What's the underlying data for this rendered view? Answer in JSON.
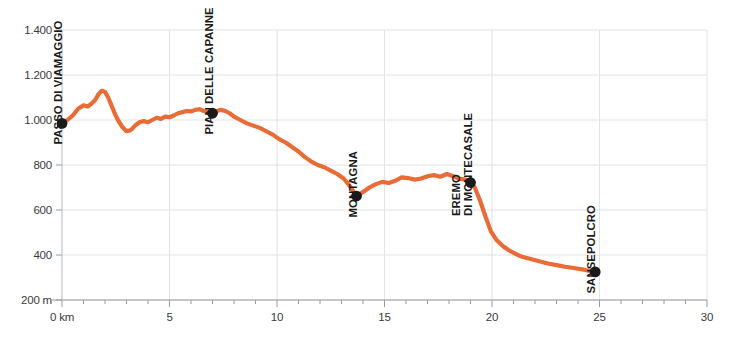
{
  "chart_data": {
    "type": "line",
    "title": "",
    "subtitle": "",
    "xlabel": "",
    "ylabel": "",
    "xlim": [
      0,
      30
    ],
    "ylim": [
      200,
      1400
    ],
    "grid": true,
    "legend": "none",
    "line_color": "#E96B35",
    "marker_color": "#1a1a1a",
    "x_unit_suffix": " km",
    "y_unit_suffix": " m",
    "x_ticks": [
      {
        "value": 0,
        "label": "0 km"
      },
      {
        "value": 5,
        "label": "5"
      },
      {
        "value": 10,
        "label": "10"
      },
      {
        "value": 15,
        "label": "15"
      },
      {
        "value": 20,
        "label": "20"
      },
      {
        "value": 25,
        "label": "25"
      },
      {
        "value": 30,
        "label": "30"
      }
    ],
    "x_minor_tick_interval": 1,
    "y_ticks": [
      {
        "value": 1400,
        "label": "1.400"
      },
      {
        "value": 1200,
        "label": "1.200"
      },
      {
        "value": 1000,
        "label": "1.000"
      },
      {
        "value": 800,
        "label": "800"
      },
      {
        "value": 600,
        "label": "600"
      },
      {
        "value": 400,
        "label": "400"
      },
      {
        "value": 200,
        "label": "200 m"
      }
    ],
    "series": [
      {
        "name": "elevation-profile",
        "x": [
          0.0,
          0.25,
          0.5,
          0.75,
          1.0,
          1.2,
          1.4,
          1.55,
          1.7,
          1.85,
          2.0,
          2.15,
          2.3,
          2.45,
          2.6,
          2.8,
          3.0,
          3.2,
          3.4,
          3.6,
          3.8,
          4.0,
          4.2,
          4.4,
          4.6,
          4.8,
          5.0,
          5.2,
          5.4,
          5.6,
          5.8,
          6.0,
          6.2,
          6.4,
          6.6,
          6.8,
          7.0,
          7.2,
          7.4,
          7.6,
          7.8,
          8.0,
          8.3,
          8.6,
          8.9,
          9.2,
          9.5,
          9.8,
          10.1,
          10.4,
          10.7,
          11.0,
          11.3,
          11.6,
          11.9,
          12.2,
          12.5,
          12.8,
          13.1,
          13.4,
          13.7,
          14.0,
          14.3,
          14.6,
          14.9,
          15.2,
          15.5,
          15.8,
          16.1,
          16.4,
          16.7,
          17.0,
          17.3,
          17.6,
          17.9,
          18.2,
          18.5,
          18.8,
          19.0,
          19.2,
          19.45,
          19.7,
          19.95,
          20.2,
          20.5,
          20.8,
          21.1,
          21.4,
          21.8,
          22.2,
          22.6,
          23.0,
          23.4,
          23.8,
          24.2,
          24.5,
          24.8
        ],
        "y": [
          985,
          1000,
          1020,
          1050,
          1065,
          1060,
          1075,
          1090,
          1115,
          1130,
          1125,
          1100,
          1065,
          1030,
          1000,
          970,
          950,
          955,
          975,
          990,
          995,
          990,
          1000,
          1010,
          1005,
          1015,
          1012,
          1020,
          1030,
          1035,
          1040,
          1038,
          1045,
          1048,
          1040,
          1035,
          1030,
          1040,
          1045,
          1040,
          1030,
          1015,
          1000,
          985,
          975,
          965,
          950,
          935,
          915,
          900,
          880,
          860,
          835,
          815,
          800,
          790,
          775,
          760,
          740,
          705,
          662,
          680,
          700,
          715,
          725,
          720,
          730,
          745,
          742,
          735,
          740,
          750,
          755,
          748,
          760,
          750,
          738,
          735,
          722,
          700,
          640,
          570,
          505,
          468,
          440,
          420,
          405,
          392,
          382,
          372,
          362,
          355,
          348,
          342,
          336,
          330,
          325
        ]
      }
    ],
    "waypoints": [
      {
        "name": "passo-di-viamaggio",
        "label_line1": "PASSO DI VIAMAGGIO",
        "label_line2": "",
        "x": 0.0,
        "y": 985
      },
      {
        "name": "pian-delle-capanne",
        "label_line1": "PIAN DELLE CAPANNE",
        "label_line2": "",
        "x": 7.0,
        "y": 1030
      },
      {
        "name": "montagna",
        "label_line1": "MONTAGNA",
        "label_line2": "",
        "x": 13.7,
        "y": 662
      },
      {
        "name": "eremo-di-montecasale",
        "label_line1": "EREMO",
        "label_line2": "DI MONTECASALE",
        "x": 19.0,
        "y": 722
      },
      {
        "name": "sansepolcro",
        "label_line1": "SANSEPOLCRO",
        "label_line2": "",
        "x": 24.8,
        "y": 325
      }
    ]
  }
}
